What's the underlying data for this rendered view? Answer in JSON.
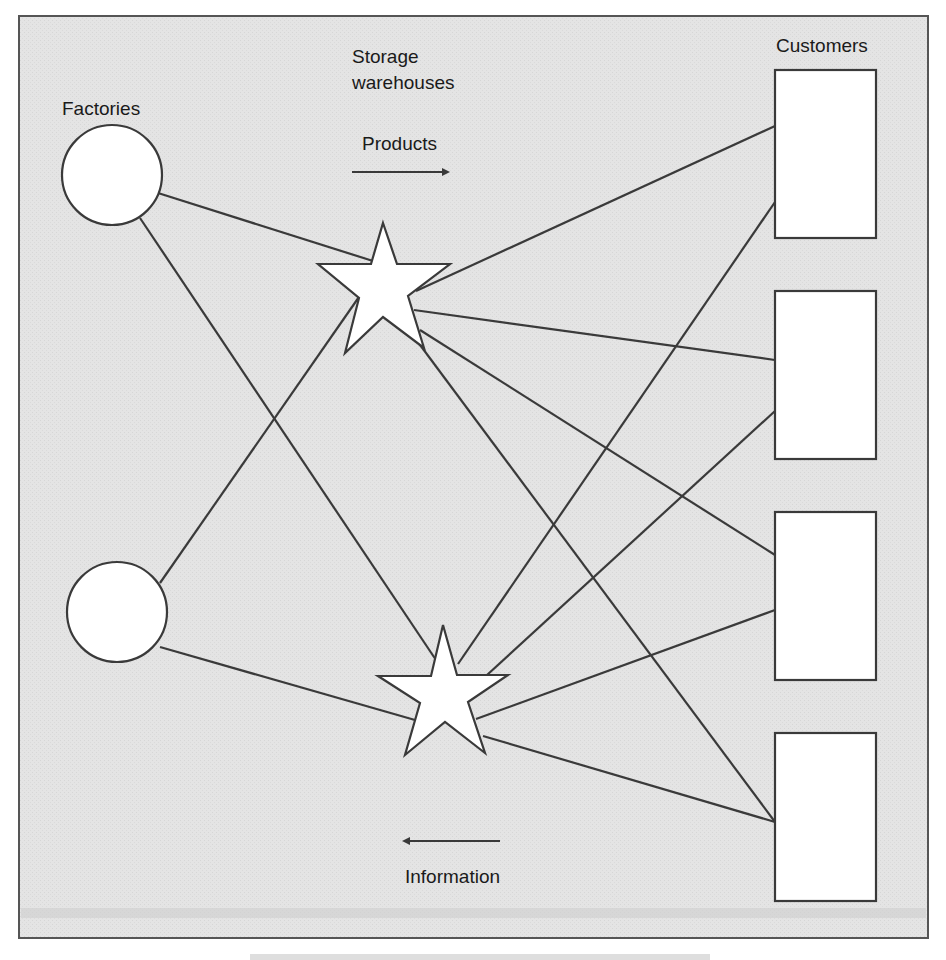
{
  "diagram": {
    "type": "supply-chain-network",
    "colors": {
      "panel_bg": "#e6e6e6",
      "frame": "#555555",
      "line": "#3a3a3a",
      "node_fill": "#ffffff",
      "text": "#1a1a1a"
    },
    "labels": {
      "factories": "Factories",
      "storage_line1": "Storage",
      "storage_line2": "warehouses",
      "customers": "Customers",
      "products": "Products",
      "information": "Information"
    },
    "arrows": {
      "products": {
        "direction": "right",
        "label": "Products"
      },
      "information": {
        "direction": "left",
        "label": "Information"
      }
    },
    "nodes": {
      "factories": [
        {
          "id": "factory-1",
          "shape": "circle"
        },
        {
          "id": "factory-2",
          "shape": "circle"
        }
      ],
      "warehouses": [
        {
          "id": "warehouse-1",
          "shape": "star"
        },
        {
          "id": "warehouse-2",
          "shape": "star"
        }
      ],
      "customers": [
        {
          "id": "customer-1",
          "shape": "rectangle"
        },
        {
          "id": "customer-2",
          "shape": "rectangle"
        },
        {
          "id": "customer-3",
          "shape": "rectangle"
        },
        {
          "id": "customer-4",
          "shape": "rectangle"
        }
      ]
    },
    "edges": [
      {
        "from": "factory-1",
        "to": "warehouse-1"
      },
      {
        "from": "factory-1",
        "to": "warehouse-2"
      },
      {
        "from": "factory-2",
        "to": "warehouse-1"
      },
      {
        "from": "factory-2",
        "to": "warehouse-2"
      },
      {
        "from": "warehouse-1",
        "to": "customer-1"
      },
      {
        "from": "warehouse-1",
        "to": "customer-2"
      },
      {
        "from": "warehouse-1",
        "to": "customer-3"
      },
      {
        "from": "warehouse-1",
        "to": "customer-4"
      },
      {
        "from": "warehouse-2",
        "to": "customer-1"
      },
      {
        "from": "warehouse-2",
        "to": "customer-2"
      },
      {
        "from": "warehouse-2",
        "to": "customer-3"
      },
      {
        "from": "warehouse-2",
        "to": "customer-4"
      }
    ]
  }
}
